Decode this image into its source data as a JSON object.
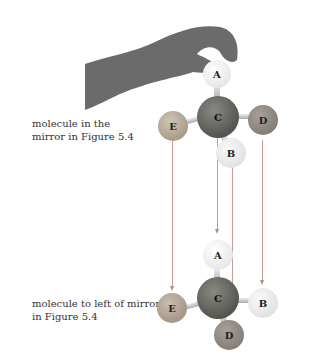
{
  "labels": {
    "top": [
      "molecule in the",
      "mirror in Figure 5.4"
    ],
    "bottom": [
      "molecule to left of mirror",
      "in Figure 5.4"
    ]
  },
  "top_molecule": {
    "A": "A",
    "C": "C",
    "D": "D",
    "E": "E",
    "B": "B"
  },
  "bottom_molecule": {
    "A": "A",
    "C": "C",
    "D": "D",
    "E": "E",
    "B": "B"
  },
  "colors": {
    "light": "#eaeaea",
    "medium": "#b5a89a",
    "dark": "#8f8782",
    "center": "#5a5a5a"
  }
}
